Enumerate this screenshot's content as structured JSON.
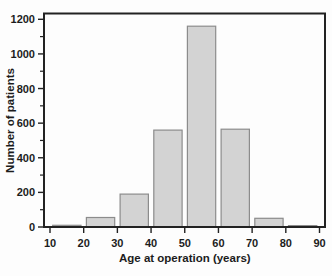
{
  "colors": {
    "background": "#fdfdfd",
    "bar_fill": "#d3d3d3",
    "bar_border": "#8c8c8c",
    "axis": "#222222",
    "text": "#1c1c1c"
  },
  "chart_data": {
    "type": "bar",
    "title": "",
    "xlabel": "Age at operation (years)",
    "ylabel": "Number of patients",
    "bin_edges": [
      10,
      20,
      30,
      40,
      50,
      60,
      70,
      80,
      90
    ],
    "values": [
      10,
      55,
      190,
      560,
      1160,
      565,
      50,
      8
    ],
    "x_ticks": [
      10,
      20,
      30,
      40,
      50,
      60,
      70,
      80,
      90
    ],
    "y_ticks": [
      0,
      200,
      400,
      600,
      800,
      1000,
      1200
    ],
    "y_minor_step": 100,
    "xlim": [
      10,
      90
    ],
    "ylim": [
      0,
      1230
    ],
    "grid": false,
    "legend": null,
    "bar_rel_width": 0.84
  }
}
